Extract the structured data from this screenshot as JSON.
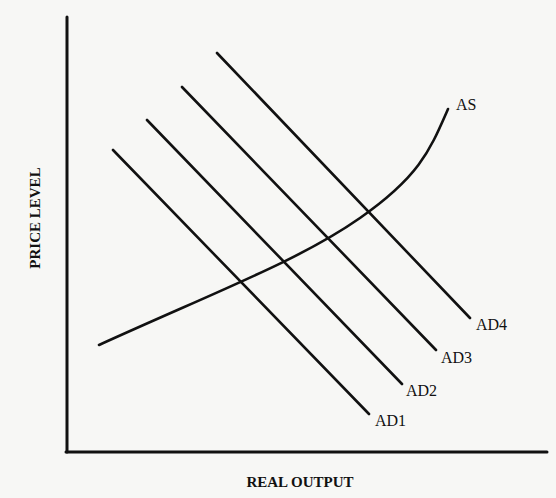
{
  "diagram": {
    "type": "economics AS-AD diagram",
    "x_axis": {
      "title": "REAL OUTPUT"
    },
    "y_axis": {
      "title": "PRICE LEVEL"
    },
    "curves": [
      {
        "id": "as",
        "label": "AS",
        "kind": "aggregate supply (upward sloping, convex)"
      },
      {
        "id": "ad1",
        "label": "AD1",
        "kind": "aggregate demand"
      },
      {
        "id": "ad2",
        "label": "AD2",
        "kind": "aggregate demand"
      },
      {
        "id": "ad3",
        "label": "AD3",
        "kind": "aggregate demand"
      },
      {
        "id": "ad4",
        "label": "AD4",
        "kind": "aggregate demand"
      }
    ]
  },
  "colors": {
    "background": "#f7f7f5",
    "ink": "#111111"
  }
}
